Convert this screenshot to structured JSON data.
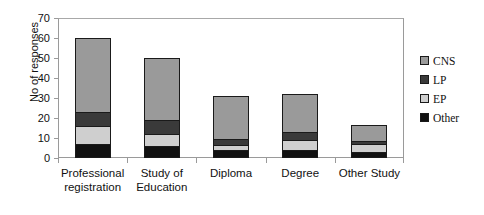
{
  "chart_data": {
    "type": "bar",
    "stacked": true,
    "title": "",
    "xlabel": "",
    "ylabel": "No of responses",
    "ylim": [
      0,
      70
    ],
    "yticks": [
      0,
      10,
      20,
      30,
      40,
      50,
      60,
      70
    ],
    "grid": false,
    "legend_position": "right",
    "categories": [
      "Professional registration",
      "Study of Education",
      "Diploma",
      "Degree",
      "Other Study"
    ],
    "category_lines": [
      [
        "Professional",
        "registration"
      ],
      [
        "Study of",
        "Education"
      ],
      [
        "Diploma",
        ""
      ],
      [
        "Degree",
        ""
      ],
      [
        "Other Study",
        ""
      ]
    ],
    "series": [
      {
        "name": "Other",
        "color": "#111111",
        "values": [
          7,
          6,
          4,
          4,
          3
        ]
      },
      {
        "name": "EP",
        "color": "#cfcfcf",
        "values": [
          9,
          6,
          2.5,
          5,
          4
        ]
      },
      {
        "name": "LP",
        "color": "#3a3a3a",
        "values": [
          7,
          7,
          3,
          4,
          1.5
        ]
      },
      {
        "name": "CNS",
        "color": "#9a9a9a",
        "values": [
          37,
          31,
          21.5,
          19,
          8
        ]
      }
    ],
    "totals": [
      60,
      50,
      31,
      32,
      16.5
    ],
    "legend_order": [
      "CNS",
      "LP",
      "EP",
      "Other"
    ],
    "legend": [
      {
        "label": "CNS",
        "color": "#9a9a9a"
      },
      {
        "label": "LP",
        "color": "#3a3a3a"
      },
      {
        "label": "EP",
        "color": "#cfcfcf"
      },
      {
        "label": "Other",
        "color": "#111111"
      }
    ]
  }
}
